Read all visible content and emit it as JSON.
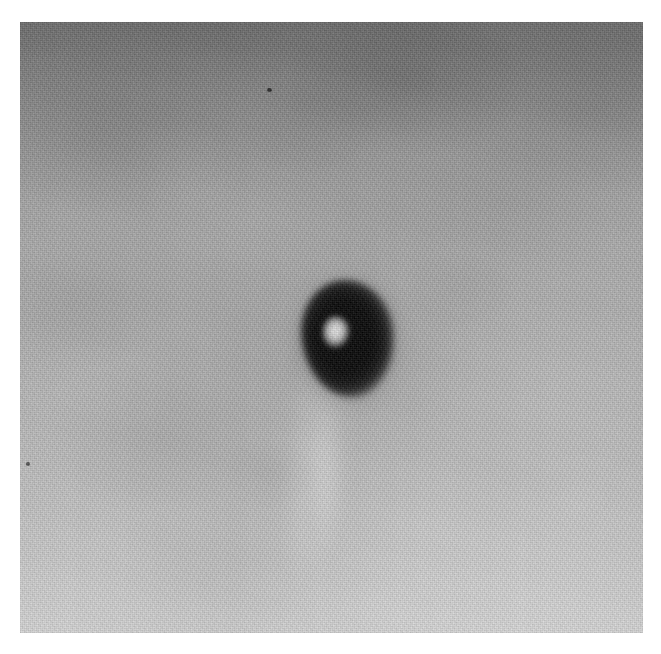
{
  "figure": {
    "domain": "Natural-Image",
    "kind": "grayscale-scientific-plate",
    "caption": "",
    "alt_text": "Grayscale grainy image with a dark oval lesion containing a bright center",
    "canvas": {
      "width_px": 661,
      "height_px": 654,
      "background_color": "#ffffff"
    },
    "plate": {
      "left_px": 20,
      "top_px": 22,
      "width_px": 623,
      "height_px": 611,
      "border": "none",
      "label": ""
    }
  },
  "tones": {
    "paper_white": "#ffffff",
    "top_darkest": "#6f6f6f",
    "upper_mid": "#8a8a8a",
    "mid_field": "#b2b2b2",
    "lower_field": "#c4c4c4",
    "bottom_lightest": "#dcdcdc",
    "lesion_dark": "#050505",
    "lesion_rim": "#242424",
    "lesion_core_bright": "#e3e3e3",
    "speck_dark": "#2b2b2b"
  },
  "features": [
    {
      "name": "dark-ovoid-lesion",
      "shape": "ovoid ring",
      "center_px": [
        328,
        318
      ],
      "width_px": 92,
      "height_px": 118,
      "rotation_deg": -4,
      "fill": "#050505",
      "note": "dense dark ovoid with diffuse halo"
    },
    {
      "name": "bright-core",
      "shape": "irregular blob",
      "center_px": [
        316,
        311
      ],
      "width_px": 28,
      "height_px": 33,
      "rotation_deg": 6,
      "fill": "#e3e3e3",
      "note": "bright lucent centre offset toward upper-left of lesion"
    },
    {
      "name": "light-vertical-streak",
      "shape": "soft vertical band",
      "center_px": [
        370,
        480
      ],
      "width_px": 95,
      "height_px": 380,
      "rotation_deg": 5,
      "fill": "rgba(255,255,255,0.26)",
      "note": "faint brighter streak descending below the lesion"
    },
    {
      "name": "dark-speck-upper",
      "shape": "dot",
      "center_px": [
        269,
        90
      ],
      "width_px": 5,
      "height_px": 4,
      "fill": "#2b2b2b",
      "note": "small stray dark artifact near top-centre"
    },
    {
      "name": "dark-speck-left",
      "shape": "dot",
      "center_px": [
        28,
        464
      ],
      "width_px": 4,
      "height_px": 4,
      "fill": "#2b2b2b",
      "note": "small stray dark artifact on the left edge"
    }
  ],
  "texture": {
    "type": "film-grain",
    "intensity": "high",
    "gradient_direction": "top-dark to bottom-light",
    "vignette": "slight"
  }
}
